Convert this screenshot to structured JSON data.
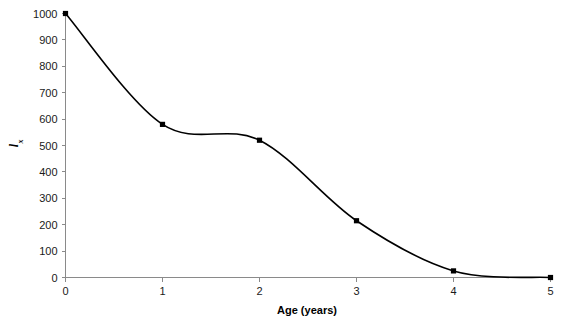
{
  "chart_data": {
    "type": "line",
    "title": "",
    "subtitle": "",
    "xlabel": "Age (years)",
    "ylabel": "lx",
    "ylabel_main": "l",
    "ylabel_sub": "x",
    "x": [
      0,
      1,
      2,
      3,
      4,
      5
    ],
    "values": [
      1000,
      580,
      520,
      215,
      25,
      0
    ],
    "series": [
      {
        "name": "lx",
        "values": [
          1000,
          580,
          520,
          215,
          25,
          0
        ]
      }
    ],
    "categories": [
      "0",
      "1",
      "2",
      "3",
      "4",
      "5"
    ],
    "xlim": [
      0,
      5
    ],
    "ylim": [
      0,
      1000
    ],
    "xticks": [
      0,
      1,
      2,
      3,
      4,
      5
    ],
    "yticks": [
      0,
      100,
      200,
      300,
      400,
      500,
      600,
      700,
      800,
      900,
      1000
    ],
    "xtick_labels": [
      "0",
      "1",
      "2",
      "3",
      "4",
      "5"
    ],
    "ytick_labels": [
      "0",
      "100",
      "200",
      "300",
      "400",
      "500",
      "600",
      "700",
      "800",
      "900",
      "1000"
    ],
    "grid": false,
    "legend": false,
    "legend_position": "none",
    "smoothed": true,
    "marker": "square",
    "annotations": [],
    "colors": {
      "curve": "#000000",
      "marker": "#000000",
      "axis": "#8a8a8a",
      "text": "#1a1a1a",
      "background": "#ffffff"
    }
  }
}
